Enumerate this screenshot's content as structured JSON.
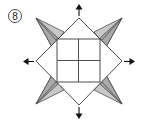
{
  "diagram": {
    "type": "origami-instruction-step",
    "step_number": "8",
    "colors": {
      "line": "#3a3a3a",
      "paper": "#ffffff",
      "flap_shade": "#c8c8c8",
      "flap_shade_dark": "#a9a9a9",
      "arrow": "#111111"
    },
    "arrows": [
      {
        "direction": "up"
      },
      {
        "direction": "down"
      },
      {
        "direction": "left"
      },
      {
        "direction": "right"
      }
    ],
    "elements": [
      "rotated outer square (diamond)",
      "inner square divided into four quadrants",
      "four shaded pointed flaps at diagonal corners",
      "four outward pulling arrows"
    ]
  }
}
